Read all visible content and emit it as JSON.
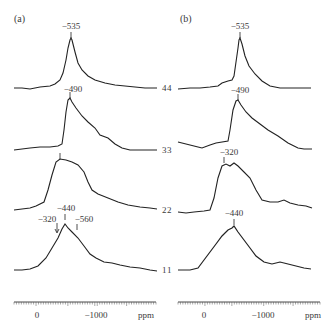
{
  "figure": {
    "panels": [
      {
        "id": "a",
        "label": "(a)",
        "traces": [
          {
            "index": "4",
            "peaks": [
              "-535"
            ]
          },
          {
            "index": "3",
            "peaks": [
              "-490"
            ]
          },
          {
            "index": "2",
            "peaks": [
              ""
            ]
          },
          {
            "index": "1",
            "peaks": [
              "-320",
              "-440",
              "-560"
            ]
          }
        ],
        "axis": {
          "tick0": "0",
          "tick1": "-1000",
          "unit": "ppm"
        }
      },
      {
        "id": "b",
        "label": "(b)",
        "traces": [
          {
            "index": "4",
            "peaks": [
              "-535"
            ]
          },
          {
            "index": "3",
            "peaks": [
              "-490"
            ]
          },
          {
            "index": "2",
            "peaks": [
              "-320"
            ]
          },
          {
            "index": "1",
            "peaks": [
              "-440"
            ]
          }
        ],
        "axis": {
          "tick0": "0",
          "tick1": "-1000",
          "unit": "ppm"
        }
      }
    ]
  },
  "chart_data": [
    {
      "type": "line",
      "title": "(a)",
      "xlabel": "ppm",
      "x_ticks": [
        "0",
        "-1000"
      ],
      "xlim": [
        500,
        -1400
      ],
      "series": [
        {
          "name": "4",
          "peak_ppm": -535,
          "annotations": [
            "-535"
          ]
        },
        {
          "name": "3",
          "peak_ppm": -490,
          "annotations": [
            "-490"
          ]
        },
        {
          "name": "2",
          "peak_ppm": -320,
          "annotations": []
        },
        {
          "name": "1",
          "peak_ppm": -440,
          "annotations": [
            "-320",
            "-440",
            "-560"
          ]
        }
      ],
      "grid": false,
      "legend": "trace numbers at right"
    },
    {
      "type": "line",
      "title": "(b)",
      "xlabel": "ppm",
      "x_ticks": [
        "0",
        "-1000"
      ],
      "xlim": [
        500,
        -1400
      ],
      "series": [
        {
          "name": "4",
          "peak_ppm": -535,
          "annotations": [
            "-535"
          ]
        },
        {
          "name": "3",
          "peak_ppm": -490,
          "annotations": [
            "-490"
          ]
        },
        {
          "name": "2",
          "peak_ppm": -320,
          "annotations": [
            "-320"
          ]
        },
        {
          "name": "1",
          "peak_ppm": -440,
          "annotations": [
            "-440"
          ]
        }
      ],
      "grid": false,
      "legend": "trace numbers at left"
    }
  ]
}
